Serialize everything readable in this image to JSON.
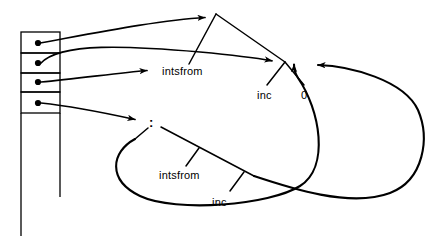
{
  "figure": {
    "type": "graph-reduction-heap-diagram",
    "width": 434,
    "height": 244,
    "background_color": "#ffffff",
    "ink_color": "#000000"
  },
  "stack": {
    "name": "pointer-cell-column",
    "left": 21,
    "right": 60,
    "top": 32,
    "cells": [
      {
        "index": 0,
        "top": 32,
        "bottom": 53,
        "pointer_dot": {
          "x": 38,
          "y": 43
        }
      },
      {
        "index": 1,
        "top": 53,
        "bottom": 73,
        "pointer_dot": {
          "x": 38,
          "y": 63
        }
      },
      {
        "index": 2,
        "top": 73,
        "bottom": 92,
        "pointer_dot": {
          "x": 38,
          "y": 82
        }
      },
      {
        "index": 3,
        "top": 92,
        "bottom": 113,
        "pointer_dot": {
          "x": 38,
          "y": 103
        }
      }
    ],
    "tail_lines": [
      {
        "name": "left-rail",
        "x": 21,
        "from_y": 113,
        "to_y": 236
      },
      {
        "name": "right-rail",
        "x": 60,
        "from_y": 113,
        "to_y": 197
      }
    ]
  },
  "nodes": {
    "apex_top": {
      "name": "top-application-node",
      "x": 216,
      "y": 14
    },
    "apply_vertex": {
      "name": "apply-vertex-node",
      "x": 285,
      "y": 62
    },
    "cons_node": {
      "name": "cons-node",
      "x": 152,
      "y": 123,
      "label": ":"
    }
  },
  "labels": [
    {
      "id": "intsfrom-upper",
      "text": "intsfrom",
      "x": 162,
      "y": 65,
      "name": "label-intsfrom-upper"
    },
    {
      "id": "inc-upper",
      "text": "inc",
      "x": 257,
      "y": 89,
      "name": "label-inc-upper"
    },
    {
      "id": "zero",
      "text": "0",
      "x": 301,
      "y": 89,
      "name": "label-zero"
    },
    {
      "id": "intsfrom-lower",
      "text": "intsfrom",
      "x": 159,
      "y": 169,
      "name": "label-intsfrom-lower"
    },
    {
      "id": "inc-lower",
      "text": "inc",
      "x": 212,
      "y": 196,
      "name": "label-inc-lower"
    }
  ],
  "edges": {
    "pointer_arrows": [
      {
        "name": "arrow-cell0-to-apex",
        "from": {
          "x": 38,
          "y": 43
        },
        "to": {
          "x": 212,
          "y": 17
        },
        "arrowhead": true
      },
      {
        "name": "arrow-cell1-to-apply-vertex",
        "from": {
          "x": 38,
          "y": 63
        },
        "to": {
          "x": 279,
          "y": 61
        },
        "arrowhead": true,
        "curved": true
      },
      {
        "name": "arrow-cell2-to-intsfrom",
        "from": {
          "x": 38,
          "y": 82
        },
        "to": {
          "x": 155,
          "y": 70
        },
        "arrowhead": true
      },
      {
        "name": "arrow-cell3-to-cons",
        "from": {
          "x": 38,
          "y": 103
        },
        "to": {
          "x": 143,
          "y": 122
        },
        "arrowhead": true
      }
    ],
    "tree_edges": [
      {
        "name": "edge-apex-to-intsfrom-stem",
        "from": {
          "x": 216,
          "y": 14
        },
        "to": {
          "x": 189,
          "y": 64
        }
      },
      {
        "name": "edge-apex-to-apply-vertex",
        "from": {
          "x": 216,
          "y": 14
        },
        "to": {
          "x": 285,
          "y": 62
        }
      },
      {
        "name": "edge-vertex-to-inc",
        "from": {
          "x": 285,
          "y": 62
        },
        "to": {
          "x": 267,
          "y": 84
        }
      },
      {
        "name": "edge-vertex-to-zero",
        "from": {
          "x": 285,
          "y": 62
        },
        "to": {
          "x": 304,
          "y": 84
        }
      },
      {
        "name": "edge-cons-left-stem",
        "from": {
          "x": 148,
          "y": 127
        },
        "to": {
          "x": 136,
          "y": 137
        }
      },
      {
        "name": "edge-cons-right-spine",
        "from": {
          "x": 160,
          "y": 126
        },
        "to": {
          "x": 253,
          "y": 175
        }
      },
      {
        "name": "edge-spine-to-intsfrom-lower",
        "from": {
          "x": 199,
          "y": 148
        },
        "to": {
          "x": 186,
          "y": 165
        }
      },
      {
        "name": "edge-spine-to-inc-lower",
        "from": {
          "x": 243,
          "y": 171
        },
        "to": {
          "x": 230,
          "y": 190
        }
      }
    ],
    "back_loops": [
      {
        "name": "inner-back-loop-to-apply-vertex",
        "arrowhead": true,
        "tip": {
          "x": 292,
          "y": 62
        }
      },
      {
        "name": "outer-back-loop-to-apply-vertex",
        "arrowhead": true,
        "tip": {
          "x": 310,
          "y": 64
        }
      }
    ]
  }
}
